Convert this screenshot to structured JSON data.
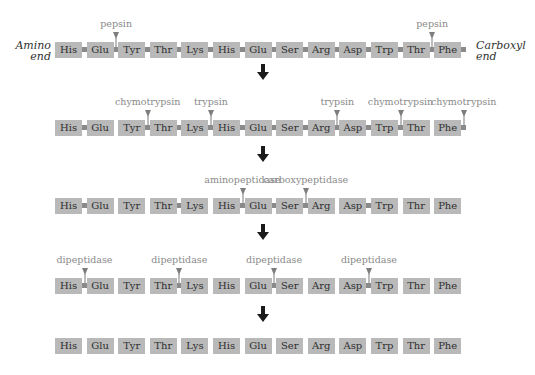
{
  "diagram": {
    "colors": {
      "residue_fill": "#b9b9b9",
      "bond": "#8a8a8a",
      "enzyme_label": "#8a8a8a",
      "arrow": "#1a1a1a",
      "text": "#2e2e2e"
    },
    "end_labels": {
      "amino_line1": "Amino",
      "amino_line2": "end",
      "carboxyl_line1": "Carboxyl",
      "carboxyl_line2": "end"
    },
    "residues": [
      "His",
      "Glu",
      "Tyr",
      "Thr",
      "Lys",
      "His",
      "Glu",
      "Ser",
      "Arg",
      "Asp",
      "Trp",
      "Thr",
      "Phe"
    ],
    "rows": [
      {
        "stage": 1,
        "bonds_present": [
          1,
          1,
          1,
          1,
          1,
          1,
          1,
          1,
          1,
          1,
          1,
          1
        ],
        "trailing_bond": true,
        "cuts": [
          {
            "after_index": 1,
            "enzyme": "pepsin"
          },
          {
            "after_index": 11,
            "enzyme": "pepsin"
          }
        ]
      },
      {
        "stage": 2,
        "bonds_present": [
          1,
          0,
          1,
          1,
          1,
          1,
          1,
          1,
          1,
          1,
          1,
          0
        ],
        "trailing_bond": true,
        "cuts": [
          {
            "after_index": 2,
            "enzyme": "chymotrypsin"
          },
          {
            "after_index": 4,
            "enzyme": "trypsin"
          },
          {
            "after_index": 8,
            "enzyme": "trypsin"
          },
          {
            "after_index": 10,
            "enzyme": "chymotrypsin"
          },
          {
            "after_index": 12,
            "enzyme": "chymotrypsin"
          }
        ]
      },
      {
        "stage": 3,
        "bonds_present": [
          1,
          0,
          0,
          1,
          0,
          1,
          1,
          1,
          0,
          1,
          0,
          0
        ],
        "trailing_bond": false,
        "cuts": [
          {
            "after_index": 5,
            "enzyme": "aminopeptidase"
          },
          {
            "after_index": 7,
            "enzyme": "carboxypeptidase"
          }
        ]
      },
      {
        "stage": 4,
        "bonds_present": [
          1,
          0,
          0,
          1,
          0,
          0,
          1,
          0,
          0,
          1,
          0,
          0
        ],
        "trailing_bond": false,
        "cuts": [
          {
            "after_index": 0,
            "enzyme": "dipeptidase"
          },
          {
            "after_index": 3,
            "enzyme": "dipeptidase"
          },
          {
            "after_index": 6,
            "enzyme": "dipeptidase"
          },
          {
            "after_index": 9,
            "enzyme": "dipeptidase"
          }
        ]
      },
      {
        "stage": 5,
        "bonds_present": [
          0,
          0,
          0,
          0,
          0,
          0,
          0,
          0,
          0,
          0,
          0,
          0
        ],
        "trailing_bond": false,
        "cuts": []
      }
    ]
  }
}
